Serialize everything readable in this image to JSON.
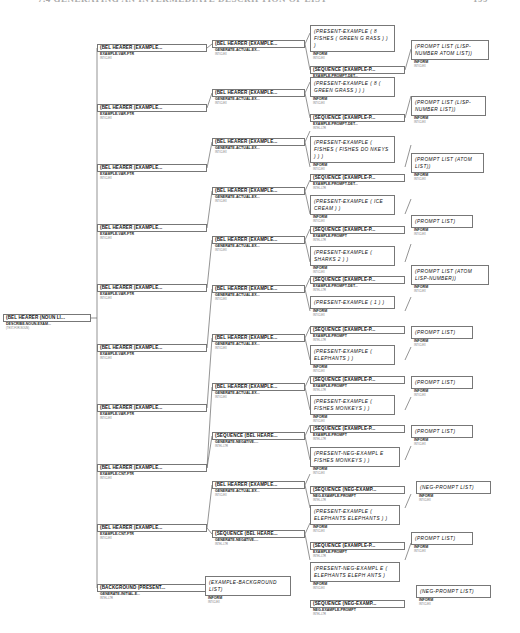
{
  "header": {
    "title": "7.4 GENERATING AN INTERMEDIATE DESCRIPTION OF LIST",
    "page": "199"
  },
  "root": {
    "label": "(BEL HEARER (NOUN LI...",
    "sub": "DESCRIBE-NOUN-EXAM...",
    "tiny": "(TEXT-FOR-NOUN)"
  },
  "col1": [
    {
      "label": "(BEL HEARER (EXAMPLE...",
      "sub": "EXAMPLE-VAR-FTR",
      "tiny": "INTICLEX"
    },
    {
      "label": "(BEL HEARER (EXAMPLE...",
      "sub": "EXAMPLE-VAR-FTR",
      "tiny": "INTICLEX"
    },
    {
      "label": "(BEL HEARER (EXAMPLE...",
      "sub": "EXAMPLE-VAR-FTR",
      "tiny": "INTICLEX"
    },
    {
      "label": "(BEL HEARER (EXAMPLE...",
      "sub": "EXAMPLE-VAR-FTR",
      "tiny": "INTICLEX"
    },
    {
      "label": "(BEL HEARER (EXAMPLE...",
      "sub": "EXAMPLE-VAR-FTR",
      "tiny": "INTICLEX"
    },
    {
      "label": "(BEL HEARER (EXAMPLE...",
      "sub": "EXAMPLE-VAR-FTR",
      "tiny": "INTICLEX"
    },
    {
      "label": "(BEL HEARER (EXAMPLE...",
      "sub": "EXAMPLE-VAR-FTR",
      "tiny": "INTICLEX"
    },
    {
      "label": "(BEL HEARER (EXAMPLE...",
      "sub": "EXAMPLE-CNT-FTR",
      "tiny": "INTICLEX"
    },
    {
      "label": "(BEL HEARER (EXAMPLE...",
      "sub": "EXAMPLE-CNT-FTR",
      "tiny": "INTICLEX"
    },
    {
      "label": "(BACKGROUND (PRESENT...",
      "sub": "GENERATE-INITIAL-E...",
      "tiny": "INTEL-LTR"
    }
  ],
  "col2": [
    {
      "label": "(BEL HEARER (EXAMPLE...",
      "sub": "GENERATE-ACTUAL-EX...",
      "tiny": "INTICLEX"
    },
    {
      "label": "(BEL HEARER (EXAMPLE...",
      "sub": "GENERATE-ACTUAL-EX...",
      "tiny": "INTICLEX"
    },
    {
      "label": "(BEL HEARER (EXAMPLE...",
      "sub": "GENERATE-ACTUAL-EX...",
      "tiny": "INTICLEX"
    },
    {
      "label": "(BEL HEARER (EXAMPLE...",
      "sub": "GENERATE-ACTUAL-EX...",
      "tiny": "INTICLEX"
    },
    {
      "label": "(BEL HEARER (EXAMPLE...",
      "sub": "GENERATE-ACTUAL-EX...",
      "tiny": "INTICLEX"
    },
    {
      "label": "(BEL HEARER (EXAMPLE...",
      "sub": "GENERATE-ACTUAL-EX...",
      "tiny": "INTICLEX"
    },
    {
      "label": "(BEL HEARER (EXAMPLE...",
      "sub": "GENERATE-ACTUAL-EX...",
      "tiny": "INTICLEX"
    },
    {
      "label": "(BEL HEARER (EXAMPLE...",
      "sub": "GENERATE-ACTUAL-EX...",
      "tiny": "INTICLEX"
    },
    {
      "label": "(SEQUENCE (BEL HEARE...",
      "sub": "GENERATE-NEGATIVE-...",
      "tiny": "INTEL-LTR"
    },
    {
      "label": "(BEL HEARER (EXAMPLE...",
      "sub": "GENERATE-ACTUAL-EX...",
      "tiny": "INTICLEX"
    },
    {
      "label": "(SEQUENCE (BEL HEARE...",
      "sub": "GENERATE-NEGATIVE-...",
      "tiny": "INTEL-LTR"
    },
    {
      "label": "(EXAMPLE-BACKGROUND LIST)",
      "sub": "INFORM",
      "tiny": "INTICLEX"
    }
  ],
  "col3": [
    {
      "label": "(PRESENT-EXAMPLE ( 8 FISHES ( GREEN G RASS ) ) )",
      "sub": "INFORM",
      "tiny": "INTICLEX"
    },
    {
      "label": "(SEQUENCE (EXAMPLE-P...",
      "sub": "EXAMPLE-PROMPT-DET...",
      "tiny": "INTEL-LTR"
    },
    {
      "label": "(PRESENT-EXAMPLE ( 8 ( GREEN GRASS ) ) )",
      "sub": "INFORM",
      "tiny": "INTICLEX"
    },
    {
      "label": "(SEQUENCE (EXAMPLE-P...",
      "sub": "EXAMPLE-PROMPT-DET...",
      "tiny": "INTEL-LTR"
    },
    {
      "label": "(PRESENT-EXAMPLE ( FISHES ( FISHES DO NKEYS ) ) )",
      "sub": "INFORM",
      "tiny": "INTICLEX"
    },
    {
      "label": "(SEQUENCE (EXAMPLE-P...",
      "sub": "EXAMPLE-PROMPT-DET...",
      "tiny": "INTEL-LTR"
    },
    {
      "label": "(PRESENT-EXAMPLE ( ICE CREAM ) )",
      "sub": "INFORM",
      "tiny": "INTICLEX"
    },
    {
      "label": "(SEQUENCE (EXAMPLE-P...",
      "sub": "EXAMPLE-PROMPT",
      "tiny": "INTEL-LTR"
    },
    {
      "label": "(PRESENT-EXAMPLE ( SHARKS 2 ) )",
      "sub": "INFORM",
      "tiny": "INTICLEX"
    },
    {
      "label": "(SEQUENCE (EXAMPLE-P...",
      "sub": "EXAMPLE-PROMPT-DET...",
      "tiny": "INTEL-LTR"
    },
    {
      "label": "(PRESENT-EXAMPLE ( 1 ) )",
      "sub": "INFORM",
      "tiny": "INTICLEX"
    },
    {
      "label": "(SEQUENCE (EXAMPLE-P...",
      "sub": "EXAMPLE-PROMPT",
      "tiny": "INTEL-LTR"
    },
    {
      "label": "(PRESENT-EXAMPLE ( ELEPHANTS ) )",
      "sub": "INFORM",
      "tiny": "INTICLEX"
    },
    {
      "label": "(SEQUENCE (EXAMPLE-P...",
      "sub": "EXAMPLE-PROMPT",
      "tiny": "INTEL-LTR"
    },
    {
      "label": "(PRESENT-EXAMPLE ( FISHES MONKEYS ) )",
      "sub": "INFORM",
      "tiny": "INTICLEX"
    },
    {
      "label": "(SEQUENCE (EXAMPLE-P...",
      "sub": "EXAMPLE-PROMPT",
      "tiny": "INTEL-LTR"
    },
    {
      "label": "(PRESENT-NEG-EXAMPL E   FISHES MONKEYS ) )",
      "sub": "INFORM",
      "tiny": "INTICLEX"
    },
    {
      "label": "(SEQUENCE (NEG-EXAMP...",
      "sub": "NEG-EXAMPLE-PROMPT",
      "tiny": "INTEL-LTR"
    },
    {
      "label": "(PRESENT-EXAMPLE ( ELEPHANTS ELEPHANTS ) )",
      "sub": "INFORM",
      "tiny": "INTICLEX"
    },
    {
      "label": "(SEQUENCE (EXAMPLE-P...",
      "sub": "EXAMPLE-PROMPT",
      "tiny": "INTEL-LTR"
    },
    {
      "label": "(PRESENT-NEG-EXAMPL E ( ELEPHANTS ELEPH ANTS   )",
      "sub": "INFORM",
      "tiny": "INTICLEX"
    },
    {
      "label": "(SEQUENCE (NEG-EXAMP...",
      "sub": "NEG-EXAMPLE-PROMPT",
      "tiny": "INTEL-LTR"
    }
  ],
  "col4": [
    {
      "label": "(PROMPT LIST (LISP-NUMBER ATOM LIST))",
      "sub": "INFORM",
      "tiny": "INTICLEX"
    },
    {
      "label": "(PROMPT LIST (LISP-NUMBER LIST))",
      "sub": "INFORM",
      "tiny": "INTICLEX"
    },
    {
      "label": "(PROMPT LIST (ATOM LIST))",
      "sub": "INFORM",
      "tiny": "INTICLEX"
    },
    {
      "label": "(PROMPT LIST)",
      "sub": "INFORM",
      "tiny": "INTICLEX"
    },
    {
      "label": "(PROMPT LIST (ATOM LISP-NUMBER))",
      "sub": "INFORM",
      "tiny": "INTICLEX"
    },
    {
      "label": "(PROMPT LIST)",
      "sub": "INFORM",
      "tiny": "INTICLEX"
    },
    {
      "label": "(PROMPT LIST)",
      "sub": "INFORM",
      "tiny": "INTICLEX"
    },
    {
      "label": "(PROMPT LIST)",
      "sub": "INFORM",
      "tiny": "INTICLEX"
    },
    {
      "label": "(NEG-PROMPT LIST)",
      "sub": "INFORM",
      "tiny": "INTICLEX"
    },
    {
      "label": "(PROMPT LIST)",
      "sub": "INFORM",
      "tiny": "INTICLEX"
    },
    {
      "label": "(NEG-PROMPT LIST)",
      "sub": "INFORM",
      "tiny": "INTICLEX"
    }
  ]
}
